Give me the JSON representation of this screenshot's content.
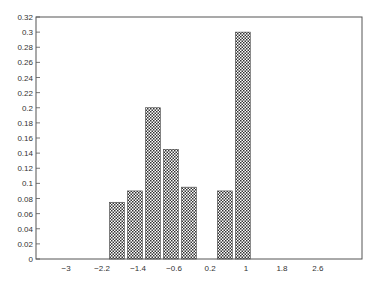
{
  "chart_data": {
    "type": "bar",
    "title": "",
    "xlabel": "",
    "ylabel": "",
    "x_ticks": [
      "-3",
      "-2.2",
      "-1.4",
      "-0.6",
      "0.2",
      "1",
      "1.8",
      "2.6"
    ],
    "x_tick_values": [
      -3,
      -2.2,
      -1.4,
      -0.6,
      0.2,
      1,
      1.8,
      2.6
    ],
    "y_ticks": [
      "0",
      "0.02",
      "0.04",
      "0.06",
      "0.08",
      "0.1",
      "0.12",
      "0.14",
      "0.16",
      "0.18",
      "0.2",
      "0.22",
      "0.24",
      "0.26",
      "0.28",
      "0.3",
      "0.32"
    ],
    "xlim": [
      -3.67,
      3.58
    ],
    "ylim": [
      0,
      0.32
    ],
    "grid": false,
    "bar_fill": "crosshatch",
    "bars": [
      {
        "center": -1.87,
        "width": 0.33,
        "value": 0.075
      },
      {
        "center": -1.47,
        "width": 0.33,
        "value": 0.09
      },
      {
        "center": -1.07,
        "width": 0.33,
        "value": 0.2
      },
      {
        "center": -0.67,
        "width": 0.33,
        "value": 0.145
      },
      {
        "center": -0.27,
        "width": 0.33,
        "value": 0.095
      },
      {
        "center": 0.53,
        "width": 0.33,
        "value": 0.09
      },
      {
        "center": 0.93,
        "width": 0.33,
        "value": 0.3
      }
    ],
    "categories": [
      "-1.87",
      "-1.47",
      "-1.07",
      "-0.67",
      "-0.27",
      "0.53",
      "0.93"
    ],
    "values": [
      0.075,
      0.09,
      0.2,
      0.145,
      0.095,
      0.09,
      0.3
    ]
  }
}
